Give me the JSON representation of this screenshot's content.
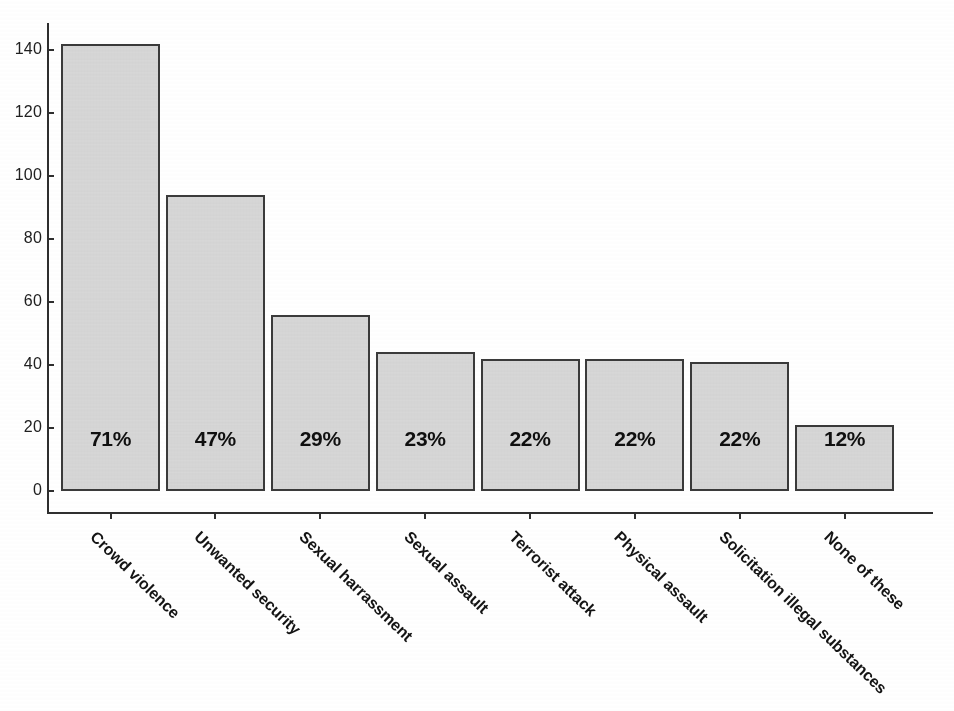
{
  "chart_data": {
    "type": "bar",
    "title": "",
    "subtitle": "",
    "xlabel": "",
    "ylabel": "",
    "ylim": [
      0,
      148
    ],
    "grid": false,
    "legend": null,
    "categories": [
      "Crowd violence",
      "Unwanted security",
      "Sexual harrassment",
      "Sexual assault",
      "Terrorist attack",
      "Physical assault",
      "Solicitation illegal substances",
      "None of these"
    ],
    "values": [
      142,
      94,
      56,
      44,
      42,
      42,
      41,
      21
    ],
    "data_labels": [
      "71%",
      "47%",
      "29%",
      "23%",
      "22%",
      "22%",
      "22%",
      "12%"
    ],
    "percent_values": [
      71,
      47,
      29,
      23,
      22,
      22,
      22,
      12
    ],
    "y_ticks": [
      0,
      20,
      40,
      60,
      80,
      100,
      120,
      140
    ],
    "y_tick_labels": [
      "0",
      "20",
      "40",
      "60",
      "80",
      "100",
      "120",
      "140"
    ],
    "colors": {
      "bar_fill": "#d9d9d9",
      "bar_border": "#3a3a3a",
      "axis": "#2e2e2e",
      "text": "#141414",
      "background": "#ffffff"
    }
  }
}
